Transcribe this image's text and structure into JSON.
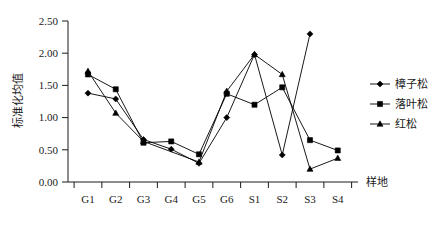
{
  "chart_data": {
    "type": "line",
    "title": "",
    "xlabel": "样地",
    "ylabel": "标准化均值",
    "categories": [
      "G1",
      "G2",
      "G3",
      "G4",
      "G5",
      "G6",
      "S1",
      "S2",
      "S3",
      "S4"
    ],
    "ylim": [
      0.0,
      2.5
    ],
    "ytick_labels": [
      "0.00",
      "0.50",
      "1.00",
      "1.50",
      "2.00",
      "2.50"
    ],
    "ytick_values": [
      0.0,
      0.5,
      1.0,
      1.5,
      2.0,
      2.5
    ],
    "grid": false,
    "legend_position": "right",
    "series": [
      {
        "name": "樟子松",
        "marker": "diamond",
        "values": [
          1.38,
          1.29,
          0.66,
          0.51,
          0.29,
          1.0,
          1.98,
          0.42,
          2.3,
          null
        ]
      },
      {
        "name": "落叶松",
        "marker": "square",
        "values": [
          1.67,
          1.44,
          0.61,
          0.63,
          0.43,
          1.37,
          1.2,
          1.47,
          0.65,
          0.49
        ]
      },
      {
        "name": "红松",
        "marker": "triangle",
        "values": [
          1.72,
          1.07,
          0.63,
          null,
          0.31,
          1.41,
          1.98,
          1.67,
          0.2,
          0.37
        ]
      }
    ]
  },
  "legend": {
    "items": [
      {
        "label": "樟子松",
        "marker": "diamond"
      },
      {
        "label": "落叶松",
        "marker": "square"
      },
      {
        "label": "红松",
        "marker": "triangle"
      }
    ]
  },
  "axes": {
    "y_title": "标准化均值",
    "x_title": "样地"
  }
}
